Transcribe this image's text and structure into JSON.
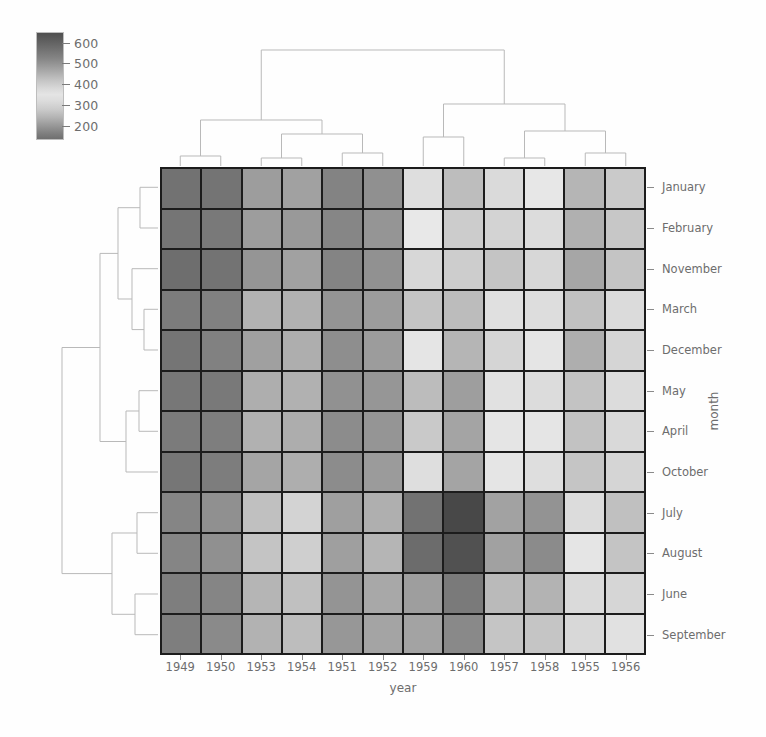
{
  "figure": {
    "type": "clustermap",
    "x_axis_label": "year",
    "y_axis_label": "month"
  },
  "colorbar": {
    "name": "passenger-count-colorbar",
    "ticks": [
      {
        "value": "600",
        "pos": 0.1
      },
      {
        "value": "500",
        "pos": 0.29
      },
      {
        "value": "400",
        "pos": 0.49
      },
      {
        "value": "300",
        "pos": 0.69
      },
      {
        "value": "200",
        "pos": 0.885
      }
    ],
    "vmin": 104,
    "vmax": 622
  },
  "chart_data": {
    "type": "heatmap",
    "title": "",
    "xlabel": "year",
    "ylabel": "month",
    "colorbar_label": "",
    "cmap": "grayscale-dark-light-dark",
    "vmin": 104,
    "vmax": 622,
    "grid": true,
    "legend_position": "top-left-colorbar",
    "categories": [
      "1949",
      "1950",
      "1953",
      "1954",
      "1951",
      "1952",
      "1959",
      "1960",
      "1957",
      "1958",
      "1955",
      "1956"
    ],
    "rows": [
      "January",
      "February",
      "November",
      "March",
      "December",
      "May",
      "April",
      "October",
      "July",
      "August",
      "June",
      "September"
    ],
    "values": [
      [
        112,
        115,
        196,
        204,
        145,
        171,
        360,
        417,
        315,
        340,
        242,
        284
      ],
      [
        118,
        126,
        196,
        188,
        150,
        180,
        342,
        391,
        301,
        318,
        233,
        277
      ],
      [
        104,
        114,
        180,
        203,
        146,
        172,
        310,
        390,
        271,
        310,
        213,
        271
      ],
      [
        132,
        141,
        236,
        235,
        178,
        193,
        406,
        419,
        356,
        362,
        267,
        317
      ],
      [
        118,
        141,
        201,
        229,
        166,
        194,
        337,
        432,
        305,
        336,
        229,
        306
      ],
      [
        121,
        125,
        229,
        234,
        172,
        183,
        420,
        472,
        355,
        363,
        270,
        318
      ],
      [
        129,
        135,
        235,
        227,
        163,
        181,
        396,
        461,
        348,
        348,
        269,
        313
      ],
      [
        119,
        133,
        211,
        229,
        162,
        191,
        359,
        461,
        347,
        359,
        274,
        306
      ],
      [
        148,
        170,
        264,
        302,
        199,
        230,
        548,
        622,
        465,
        491,
        364,
        413
      ],
      [
        148,
        170,
        272,
        293,
        199,
        242,
        559,
        606,
        467,
        505,
        347,
        405
      ],
      [
        135,
        149,
        243,
        264,
        178,
        218,
        472,
        535,
        422,
        435,
        315,
        374
      ],
      [
        136,
        158,
        237,
        259,
        184,
        209,
        463,
        508,
        404,
        404,
        312,
        355
      ]
    ],
    "column_dendrogram": {
      "description": "hierarchical clustering of years (top)",
      "leaves": [
        "1949",
        "1950",
        "1953",
        "1954",
        "1951",
        "1952",
        "1959",
        "1960",
        "1957",
        "1958",
        "1955",
        "1956"
      ]
    },
    "row_dendrogram": {
      "description": "hierarchical clustering of months (left)",
      "leaves": [
        "January",
        "February",
        "November",
        "March",
        "December",
        "May",
        "April",
        "October",
        "July",
        "August",
        "June",
        "September"
      ]
    }
  }
}
